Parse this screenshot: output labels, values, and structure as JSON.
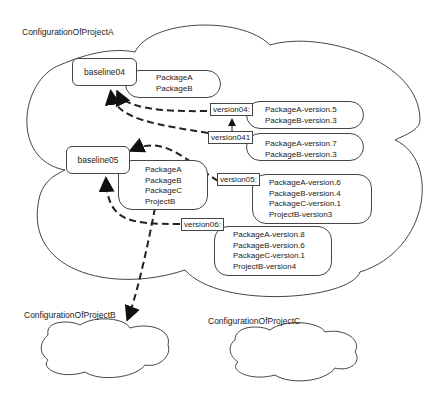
{
  "clouds": {
    "projectA": {
      "label": "ConfigurationOfProjectA"
    },
    "projectB": {
      "label": "ConfigurationOfProjectB"
    },
    "projectC": {
      "label": "ConfigurationOfProjectC"
    }
  },
  "baselines": [
    {
      "name": "baseline04",
      "packages": [
        "PackageA",
        "PackageB"
      ]
    },
    {
      "name": "baseline05",
      "packages": [
        "PackageA",
        "PackageB",
        "PackageC",
        "ProjectB"
      ]
    }
  ],
  "versions": [
    {
      "name": "version04:",
      "items": [
        "PackageA-version.5",
        "PackageB-version.3"
      ]
    },
    {
      "name": "version041",
      "items": [
        "PackageA-version.7",
        "PackageB-version.3"
      ]
    },
    {
      "name": "version05:",
      "items": [
        "PackageA-version.6",
        "PackageB-version.4",
        "PackageC-version.1",
        "ProjectB-version3"
      ]
    },
    {
      "name": "version06:",
      "items": [
        "PackageA-version.8",
        "PackageB-version.6",
        "PackageC-version.1",
        "ProjectB-version4"
      ]
    }
  ]
}
